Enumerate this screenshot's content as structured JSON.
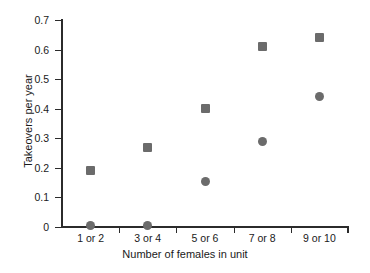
{
  "chart_data": {
    "type": "scatter",
    "title": "",
    "xlabel": "Number of females in unit",
    "ylabel": "Takeovers per year",
    "categories": [
      "1 or 2",
      "3 or 4",
      "5 or 6",
      "7 or 8",
      "9 or 10"
    ],
    "ylim": [
      0,
      0.7
    ],
    "ytick_labels": [
      "0",
      "0.1",
      "0.2",
      "0.3",
      "0.4",
      "0.5",
      "0.6",
      "0.7"
    ],
    "ytick_values": [
      0,
      0.1,
      0.2,
      0.3,
      0.4,
      0.5,
      0.6,
      0.7
    ],
    "grid": false,
    "legend": "none",
    "marker_color": "#6b6b6b",
    "axis_color": "#2b2b2b",
    "series": [
      {
        "name": "square-series",
        "marker": "square",
        "values": [
          0.19,
          0.27,
          0.4,
          0.61,
          0.64
        ]
      },
      {
        "name": "circle-series",
        "marker": "circle",
        "values": [
          0.005,
          0.005,
          0.155,
          0.29,
          0.44
        ]
      }
    ]
  }
}
